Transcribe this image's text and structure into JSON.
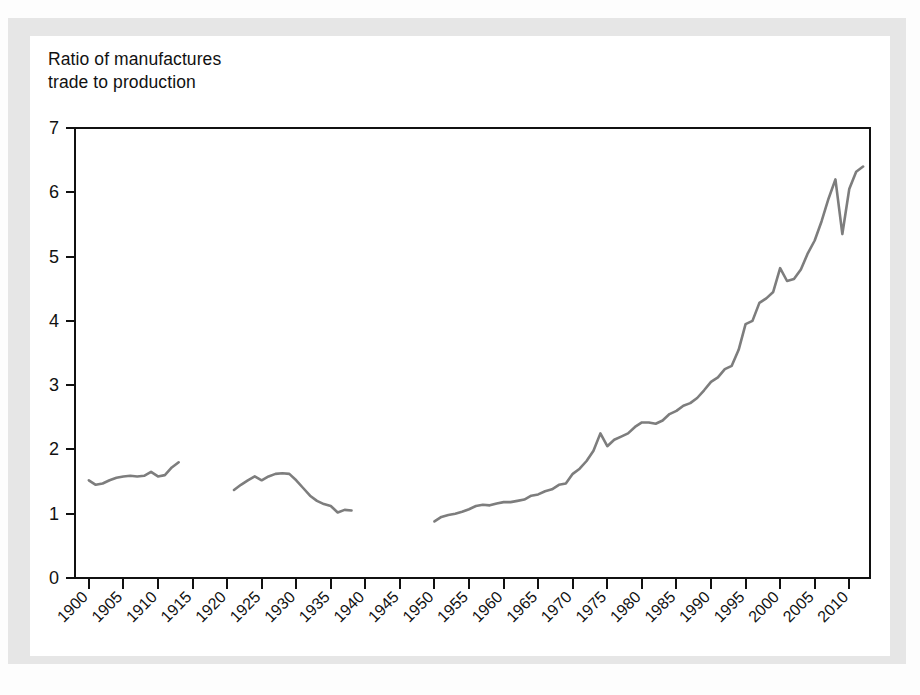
{
  "figure": {
    "title_line1": "Ratio of manufactures",
    "title_line2": "trade to production",
    "title": "Ratio of manufactures\ntrade to production",
    "line_color": "#7d7d7d",
    "axis_color": "#111111",
    "card_background": "#ffffff",
    "frame_background": "#e6e6e6"
  },
  "chart_data": {
    "type": "line",
    "title": "Ratio of manufactures trade to production",
    "xlabel": "",
    "ylabel": "Ratio of manufactures trade to production",
    "xlim": [
      1898,
      2013
    ],
    "ylim": [
      0,
      7
    ],
    "yticks": [
      0,
      1,
      2,
      3,
      4,
      5,
      6,
      7
    ],
    "xticks": [
      1900,
      1905,
      1910,
      1915,
      1920,
      1925,
      1930,
      1935,
      1940,
      1945,
      1950,
      1955,
      1960,
      1965,
      1970,
      1975,
      1980,
      1985,
      1990,
      1995,
      2000,
      2005,
      2010
    ],
    "ytick_labels": [
      "0",
      "1",
      "2",
      "3",
      "4",
      "5",
      "6",
      "7"
    ],
    "xtick_labels": [
      "1900",
      "1905",
      "1910",
      "1915",
      "1920",
      "1925",
      "1930",
      "1935",
      "1940",
      "1945",
      "1950",
      "1955",
      "1960",
      "1965",
      "1970",
      "1975",
      "1980",
      "1985",
      "1990",
      "1995",
      "2000",
      "2005",
      "2010"
    ],
    "xtick_rotation": -45,
    "grid": false,
    "legend": false,
    "series": [
      {
        "name": "Pre-WWI",
        "x": [
          1900,
          1901,
          1902,
          1903,
          1904,
          1905,
          1906,
          1907,
          1908,
          1909,
          1910,
          1911,
          1912,
          1913
        ],
        "values": [
          1.52,
          1.45,
          1.47,
          1.52,
          1.56,
          1.58,
          1.59,
          1.58,
          1.59,
          1.65,
          1.58,
          1.6,
          1.72,
          1.8
        ]
      },
      {
        "name": "Interwar",
        "x": [
          1921,
          1922,
          1923,
          1924,
          1925,
          1926,
          1927,
          1928,
          1929,
          1930,
          1931,
          1932,
          1933,
          1934,
          1935,
          1936,
          1937,
          1938
        ],
        "values": [
          1.37,
          1.45,
          1.52,
          1.58,
          1.52,
          1.58,
          1.62,
          1.63,
          1.62,
          1.52,
          1.4,
          1.28,
          1.2,
          1.15,
          1.12,
          1.02,
          1.06,
          1.05
        ]
      },
      {
        "name": "Post-WWII",
        "x": [
          1950,
          1951,
          1952,
          1953,
          1954,
          1955,
          1956,
          1957,
          1958,
          1959,
          1960,
          1961,
          1962,
          1963,
          1964,
          1965,
          1966,
          1967,
          1968,
          1969,
          1970,
          1971,
          1972,
          1973,
          1974,
          1975,
          1976,
          1977,
          1978,
          1979,
          1980,
          1981,
          1982,
          1983,
          1984,
          1985,
          1986,
          1987,
          1988,
          1989,
          1990,
          1991,
          1992,
          1993,
          1994,
          1995,
          1996,
          1997,
          1998,
          1999,
          2000,
          2001,
          2002,
          2003,
          2004,
          2005,
          2006,
          2007,
          2008,
          2009,
          2010,
          2011,
          2012
        ],
        "values": [
          0.88,
          0.95,
          0.98,
          1.0,
          1.03,
          1.07,
          1.12,
          1.14,
          1.13,
          1.16,
          1.18,
          1.18,
          1.2,
          1.22,
          1.28,
          1.3,
          1.35,
          1.38,
          1.45,
          1.47,
          1.62,
          1.7,
          1.82,
          1.98,
          2.25,
          2.05,
          2.15,
          2.2,
          2.25,
          2.35,
          2.42,
          2.42,
          2.4,
          2.45,
          2.55,
          2.6,
          2.68,
          2.72,
          2.8,
          2.92,
          3.05,
          3.12,
          3.25,
          3.3,
          3.55,
          3.95,
          4.0,
          4.28,
          4.35,
          4.45,
          4.82,
          4.62,
          4.65,
          4.8,
          5.05,
          5.25,
          5.55,
          5.9,
          6.2,
          5.35,
          6.05,
          6.32,
          6.4
        ]
      }
    ]
  }
}
